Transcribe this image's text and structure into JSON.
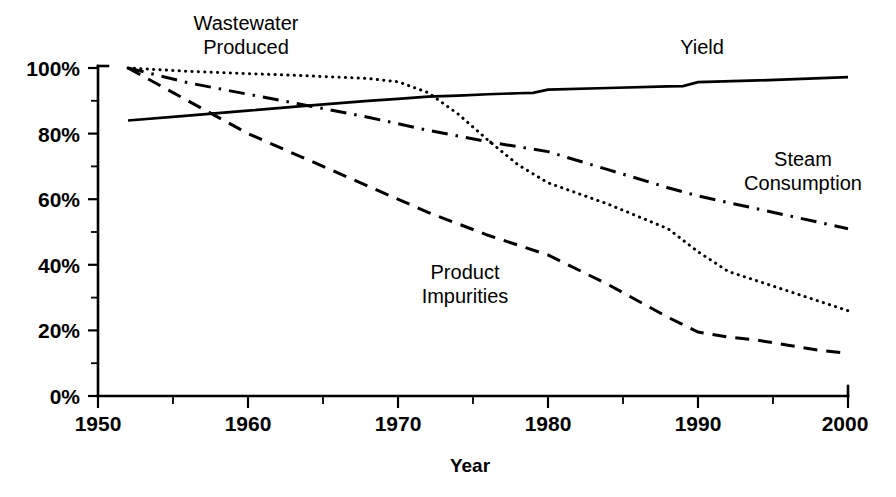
{
  "chart_data": {
    "type": "line",
    "title": "",
    "xlabel": "Year",
    "ylabel": "",
    "xlim": [
      1950,
      2000
    ],
    "ylim": [
      0,
      100
    ],
    "grid": false,
    "legend_position": "inline-annotations",
    "x_ticks": [
      1950,
      1960,
      1970,
      1980,
      1990,
      2000
    ],
    "x_tick_labels": [
      "1950",
      "1960",
      "1970",
      "1980",
      "1990",
      "2000"
    ],
    "x_minor_tick_step": 5,
    "y_ticks": [
      0,
      20,
      40,
      60,
      80,
      100
    ],
    "y_tick_labels": [
      "0%",
      "20%",
      "40%",
      "60%",
      "80%",
      "100%"
    ],
    "y_minor_tick_step": 10,
    "series": [
      {
        "name": "Yield",
        "style": "solid",
        "x": [
          1952,
          1956,
          1960,
          1964,
          1968,
          1970,
          1972,
          1974,
          1976,
          1978,
          1979,
          1980,
          1984,
          1988,
          1989,
          1990,
          1994,
          2000
        ],
        "values": [
          84,
          85.5,
          87,
          88.5,
          90,
          90.6,
          91.3,
          91.6,
          92,
          92.3,
          92.4,
          93.4,
          93.9,
          94.4,
          94.5,
          95.7,
          96.2,
          97.2
        ]
      },
      {
        "name": "Wastewater Produced",
        "style": "dotted",
        "x": [
          1952,
          1956,
          1960,
          1964,
          1968,
          1970,
          1972,
          1974,
          1976,
          1978,
          1980,
          1984,
          1988,
          1990,
          1992,
          1994,
          1996,
          1998,
          2000
        ],
        "values": [
          100,
          99,
          98.3,
          97.6,
          96.8,
          95.8,
          92.5,
          86,
          78,
          70.5,
          65,
          58.5,
          51,
          44,
          38,
          35,
          32,
          29,
          26
        ]
      },
      {
        "name": "Steam Consumption",
        "style": "dashdot",
        "x": [
          1952,
          1956,
          1960,
          1964,
          1968,
          1972,
          1976,
          1980,
          1984,
          1988,
          1990,
          1994,
          1998,
          2000
        ],
        "values": [
          100,
          95.5,
          92,
          88.5,
          85,
          81,
          77.5,
          74.5,
          69,
          63.5,
          61,
          57,
          53,
          51
        ]
      },
      {
        "name": "Product Impurities",
        "style": "dashed",
        "x": [
          1952,
          1956,
          1960,
          1964,
          1968,
          1972,
          1976,
          1980,
          1984,
          1988,
          1990,
          1992,
          1994,
          1996,
          1998,
          2000
        ],
        "values": [
          100,
          90,
          80,
          72,
          64,
          56,
          49,
          43,
          34,
          24,
          19.5,
          18,
          17,
          15.5,
          14,
          13
        ]
      }
    ],
    "annotations": [
      {
        "text_line1": "Wastewater",
        "text_line2": "Produced",
        "x": 1950,
        "y": 100,
        "anchor": "label-wastewater"
      },
      {
        "text_line1": "Yield",
        "text_line2": "",
        "x": 1984,
        "y": 104,
        "anchor": "label-yield"
      },
      {
        "text_line1": "Steam",
        "text_line2": "Consumption",
        "x": 1996,
        "y": 72,
        "anchor": "label-steam"
      },
      {
        "text_line1": "Product",
        "text_line2": "Impurities",
        "x": 1974,
        "y": 38,
        "anchor": "label-product"
      }
    ],
    "colors": {
      "line": "#000000",
      "axis": "#000000",
      "background": "#ffffff"
    }
  },
  "labels": {
    "wastewater_line1": "Wastewater",
    "wastewater_line2": "Produced",
    "yield": "Yield",
    "steam_line1": "Steam",
    "steam_line2": "Consumption",
    "product_line1": "Product",
    "product_line2": "Impurities",
    "x_axis_title": "Year"
  },
  "y_axis": {
    "t0": "0%",
    "t20": "20%",
    "t40": "40%",
    "t60": "60%",
    "t80": "80%",
    "t100": "100%"
  },
  "x_axis": {
    "t1950": "1950",
    "t1960": "1960",
    "t1970": "1970",
    "t1980": "1980",
    "t1990": "1990",
    "t2000": "2000"
  }
}
